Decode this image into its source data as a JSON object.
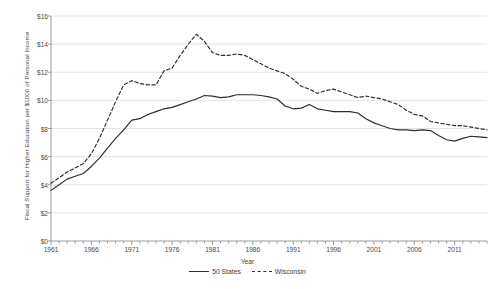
{
  "chart_data": {
    "type": "line",
    "title": "",
    "xlabel": "Year",
    "ylabel": "Fiscal Support for Higher Education per $1000 of Personal Income",
    "xlim": [
      1961,
      2015
    ],
    "ylim": [
      0,
      16
    ],
    "ytick_values": [
      0,
      2,
      4,
      6,
      8,
      10,
      12,
      14,
      16
    ],
    "ytick_labels": [
      "$0",
      "$2",
      "$4",
      "$6",
      "$8",
      "$10",
      "$12",
      "$14",
      "$16"
    ],
    "xtick_labels": [
      "1961",
      "1966",
      "1971",
      "1976",
      "1981",
      "1986",
      "1991",
      "1996",
      "2001",
      "2006",
      "2011"
    ],
    "xtick_values": [
      1961,
      1966,
      1971,
      1976,
      1981,
      1986,
      1991,
      1996,
      2001,
      2006,
      2011
    ],
    "grid": "horizontal",
    "legend_position": "bottom",
    "x": [
      1961,
      1962,
      1963,
      1964,
      1965,
      1966,
      1967,
      1968,
      1969,
      1970,
      1971,
      1972,
      1973,
      1974,
      1975,
      1976,
      1977,
      1978,
      1979,
      1980,
      1981,
      1982,
      1983,
      1984,
      1985,
      1986,
      1987,
      1988,
      1989,
      1990,
      1991,
      1992,
      1993,
      1994,
      1995,
      1996,
      1997,
      1998,
      1999,
      2000,
      2001,
      2002,
      2003,
      2004,
      2005,
      2006,
      2007,
      2008,
      2009,
      2010,
      2011,
      2012,
      2013,
      2014,
      2015
    ],
    "series": [
      {
        "name": "50 States",
        "style": "solid",
        "color": "#2e2e2e",
        "values": [
          3.6,
          4.0,
          4.4,
          4.6,
          4.8,
          5.3,
          5.9,
          6.6,
          7.3,
          7.9,
          8.6,
          8.7,
          9.0,
          9.2,
          9.4,
          9.5,
          9.7,
          9.9,
          10.1,
          10.35,
          10.3,
          10.2,
          10.25,
          10.4,
          10.4,
          10.4,
          10.35,
          10.25,
          10.1,
          9.6,
          9.4,
          9.45,
          9.7,
          9.4,
          9.3,
          9.2,
          9.2,
          9.2,
          9.1,
          8.7,
          8.4,
          8.2,
          8.0,
          7.9,
          7.9,
          7.85,
          7.9,
          7.85,
          7.5,
          7.2,
          7.1,
          7.3,
          7.45,
          7.4,
          7.35
        ]
      },
      {
        "name": "Wisconsin",
        "style": "dashed",
        "color": "#2e2e2e",
        "values": [
          4.1,
          4.5,
          4.9,
          5.2,
          5.5,
          6.2,
          7.3,
          8.6,
          9.9,
          11.1,
          11.4,
          11.2,
          11.1,
          11.1,
          12.1,
          12.3,
          13.2,
          14.0,
          14.7,
          14.2,
          13.4,
          13.2,
          13.2,
          13.3,
          13.2,
          12.9,
          12.6,
          12.3,
          12.1,
          11.9,
          11.5,
          11.0,
          10.8,
          10.5,
          10.7,
          10.8,
          10.6,
          10.4,
          10.2,
          10.3,
          10.2,
          10.1,
          9.9,
          9.7,
          9.3,
          9.0,
          8.9,
          8.5,
          8.4,
          8.3,
          8.2,
          8.2,
          8.1,
          8.0,
          7.9
        ]
      }
    ]
  },
  "legend": {
    "items": [
      {
        "label": "50 States",
        "style": "solid"
      },
      {
        "label": "Wisconsin",
        "style": "dashed"
      }
    ]
  }
}
